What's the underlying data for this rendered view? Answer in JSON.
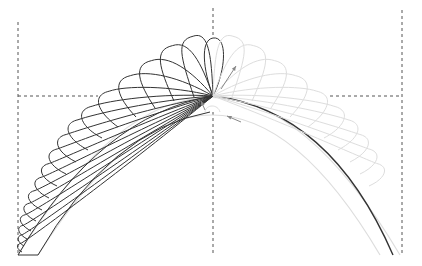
{
  "diagram": {
    "colors": {
      "background": "#ffffff",
      "active_stroke": "#333333",
      "ghost_stroke": "#dddddd",
      "guide_stroke": "#555555",
      "arrow": "#888888"
    },
    "guides": {
      "verticals_x": [
        18,
        213,
        402
      ],
      "horizontal_y": 96,
      "baseline_y": 255
    },
    "arch": {
      "apex": [
        213,
        95
      ],
      "left_foot_outer": [
        18,
        255
      ],
      "left_foot_inner": [
        38,
        255
      ],
      "right_foot": [
        393,
        255
      ]
    },
    "feathers_left_count": 17,
    "feathers_right_ghost_count": 10,
    "arrows": [
      "stitch-direction-up",
      "stitch-direction-return",
      "stitch-direction-left"
    ]
  }
}
